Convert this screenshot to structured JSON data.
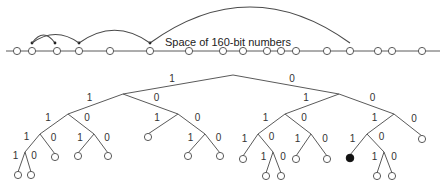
{
  "diagram": {
    "label": "Space of 160-bit numbers",
    "number_line": {
      "y": 51,
      "x_start": 6,
      "x_end": 440,
      "node_x": [
        17,
        32,
        57,
        79,
        110,
        150,
        189,
        223,
        243,
        267,
        281,
        296,
        327,
        350,
        378,
        392,
        422
      ]
    },
    "jumps": [
      {
        "from": 350,
        "to": 150
      },
      {
        "from": 150,
        "to": 79
      },
      {
        "from": 79,
        "to": 32
      },
      {
        "from": 32,
        "to": 55
      }
    ],
    "tree": {
      "nodes": {
        "root": [
          233,
          75
        ],
        "a": [
          123,
          94
        ],
        "b": [
          339,
          94
        ],
        "aa": [
          68,
          114
        ],
        "ab": [
          178,
          114
        ],
        "ba": [
          285,
          114
        ],
        "bb": [
          394,
          114
        ],
        "aaa": [
          40,
          134
        ],
        "aab": [
          94,
          134
        ],
        "aba": [
          148,
          134
        ],
        "abb": [
          205,
          134
        ],
        "baa": [
          258,
          134
        ],
        "bab": [
          311,
          134
        ],
        "bba": [
          367,
          134
        ],
        "bbb": [
          422,
          136
        ],
        "aaaa": [
          25,
          152
        ],
        "aaab": [
          55,
          154
        ],
        "aaba": [
          78,
          153
        ],
        "aabb": [
          108,
          153
        ],
        "abba": [
          188,
          153
        ],
        "abbb": [
          220,
          153
        ],
        "baaa": [
          243,
          156
        ],
        "baab": [
          273,
          152
        ],
        "baba": [
          296,
          156
        ],
        "babb": [
          327,
          156
        ],
        "bbaa": [
          350,
          155
        ],
        "bbab": [
          384,
          152
        ],
        "aaaaa": [
          18,
          172
        ],
        "aaaab": [
          31,
          172
        ],
        "baaba": [
          266,
          173
        ],
        "baabb": [
          281,
          173
        ],
        "bbaba": [
          377,
          173
        ],
        "bbabb": [
          392,
          173
        ]
      },
      "edges": [
        [
          "root",
          "a",
          "1"
        ],
        [
          "root",
          "b",
          "0"
        ],
        [
          "a",
          "aa",
          "1"
        ],
        [
          "a",
          "ab",
          "0"
        ],
        [
          "b",
          "ba",
          "1"
        ],
        [
          "b",
          "bb",
          "0"
        ],
        [
          "aa",
          "aaa",
          "1"
        ],
        [
          "aa",
          "aab",
          "0"
        ],
        [
          "ab",
          "aba",
          "1"
        ],
        [
          "ab",
          "abb",
          "0"
        ],
        [
          "ba",
          "baa",
          "1"
        ],
        [
          "ba",
          "bab",
          "0"
        ],
        [
          "bb",
          "bba",
          "1"
        ],
        [
          "bb",
          "bbb",
          "0"
        ],
        [
          "aaa",
          "aaaa",
          "1"
        ],
        [
          "aaa",
          "aaab",
          "0"
        ],
        [
          "aab",
          "aaba",
          "1"
        ],
        [
          "aab",
          "aabb",
          "0"
        ],
        [
          "abb",
          "abba",
          "1"
        ],
        [
          "abb",
          "abbb",
          "0"
        ],
        [
          "baa",
          "baaa",
          "1"
        ],
        [
          "baa",
          "baab",
          "0"
        ],
        [
          "bab",
          "baba",
          "1"
        ],
        [
          "bab",
          "babb",
          "0"
        ],
        [
          "bba",
          "bbaa",
          "1"
        ],
        [
          "bba",
          "bbab",
          "0"
        ],
        [
          "aaaa",
          "aaaaa",
          "1"
        ],
        [
          "aaaa",
          "aaaab",
          "0"
        ],
        [
          "baab",
          "baaba",
          "1"
        ],
        [
          "baab",
          "baabb",
          "0"
        ],
        [
          "bbab",
          "bbaba",
          "1"
        ],
        [
          "bbab",
          "bbabb",
          "0"
        ]
      ],
      "leaves": [
        "aaab",
        "aaba",
        "aabb",
        "aba",
        "abba",
        "abbb",
        "baaa",
        "baba",
        "babb",
        "bbb",
        "aaaaa",
        "aaaab",
        "baaba",
        "baabb",
        "bbaba",
        "bbabb"
      ],
      "filled_leaves": [
        "bbaa"
      ]
    }
  }
}
